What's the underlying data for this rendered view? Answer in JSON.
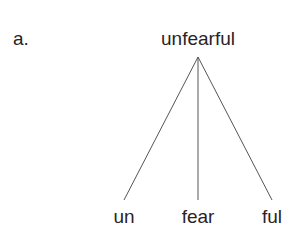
{
  "diagram": {
    "item_label": "a.",
    "root": {
      "text": "unfearful",
      "apex": {
        "x": 198,
        "y": 57
      }
    },
    "leaves": [
      {
        "text": "un",
        "end": {
          "x": 124,
          "y": 200
        }
      },
      {
        "text": "fear",
        "end": {
          "x": 198,
          "y": 200
        }
      },
      {
        "text": "ful",
        "end": {
          "x": 272,
          "y": 200
        }
      }
    ],
    "colors": {
      "text": "#2a2326",
      "lines": "#555555",
      "background": "#ffffff"
    }
  }
}
